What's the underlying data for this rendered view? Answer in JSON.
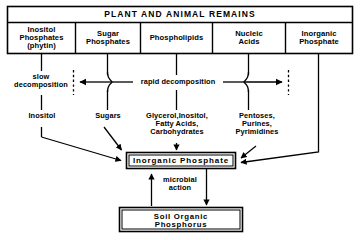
{
  "diagram": {
    "title": "PLANT AND ANIMAL REMAINS",
    "columns": [
      {
        "label": "Inositol\nPhosphates\n(phytin)"
      },
      {
        "label": "Sugar\nPhosphates"
      },
      {
        "label": "Phospholipids"
      },
      {
        "label": "Nucleic\nAcids"
      },
      {
        "label": "Inorganic\nPhosphate"
      }
    ],
    "process_labels": {
      "slow": "slow\ndecomposition",
      "rapid": "rapid decomposition",
      "microbial": "microbial\naction"
    },
    "products": [
      {
        "label": "Inositol"
      },
      {
        "label": "Sugars"
      },
      {
        "label": "Glycerol,Inositol,\nFatty Acids,\nCarbohydrates"
      },
      {
        "label": "Pentoses,\nPurines,\nPyrimidines"
      }
    ],
    "boxes": {
      "inorganic_phosphate": "Inorganic  Phosphate",
      "soil_organic_phosphorus": "Soil Organic\nPhosphorus"
    },
    "colors": {
      "ink": "#000000",
      "background": "#ffffff"
    }
  }
}
